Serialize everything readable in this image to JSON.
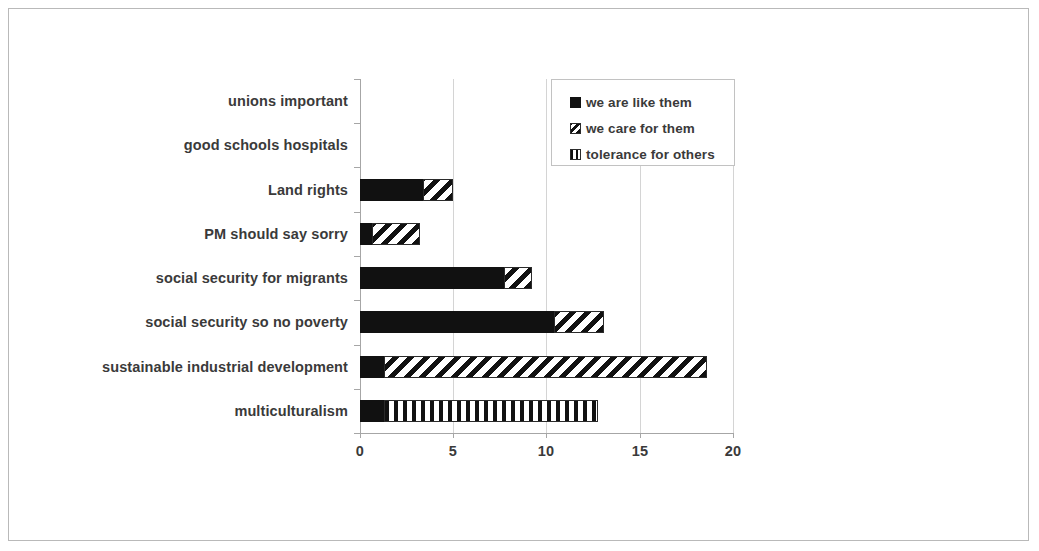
{
  "chart_data": {
    "type": "bar",
    "orientation": "horizontal",
    "stacked": true,
    "title": "",
    "subtitle": "",
    "xlabel": "",
    "ylabel": "",
    "xlim": [
      0,
      20
    ],
    "ylim": null,
    "xticks": [
      0,
      5,
      10,
      15,
      20
    ],
    "xtick_labels": [
      "0",
      "5",
      "10",
      "15",
      "20"
    ],
    "grid": "vertical",
    "legend_position": "top-right-inside",
    "categories": [
      "unions important",
      "good schools hospitals",
      "Land rights",
      "PM should say sorry",
      "social security for migrants",
      "social security so no poverty",
      "sustainable industrial development",
      "multiculturalism"
    ],
    "series": [
      {
        "name": "we are like them",
        "pattern": "solid-black",
        "color": "#111111",
        "values": [
          0,
          0,
          3.4,
          0.65,
          7.7,
          10.4,
          1.3,
          1.3
        ]
      },
      {
        "name": "we care for them",
        "pattern": "diagonal-hatch",
        "color": "#111111",
        "values": [
          0,
          0,
          1.6,
          2.55,
          1.5,
          2.7,
          17.3,
          0
        ]
      },
      {
        "name": "tolerance for others",
        "pattern": "vertical-stripes",
        "color": "#111111",
        "values": [
          0,
          0,
          0,
          0,
          0,
          0,
          0,
          11.45
        ]
      }
    ],
    "totals": [
      0,
      0,
      5.0,
      3.2,
      9.2,
      13.1,
      18.6,
      12.75
    ]
  },
  "legend": {
    "items": [
      {
        "label": "we are like them",
        "key": "solid-black-key"
      },
      {
        "label": "we care for them",
        "key": "diagonal-hatch-key"
      },
      {
        "label": "tolerance for others",
        "key": "vertical-stripes-key"
      }
    ]
  },
  "colors": {
    "bar": "#111111",
    "axis": "#a6a6a6",
    "grid": "#d4d4d4",
    "text": "#3a3a3a",
    "frame": "#b9b9b9",
    "background": "#ffffff"
  }
}
